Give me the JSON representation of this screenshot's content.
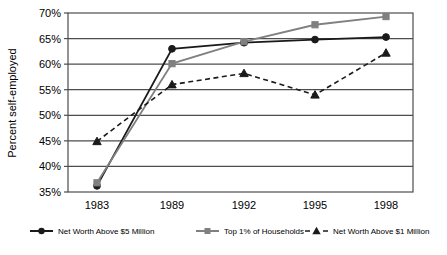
{
  "chart_data": {
    "type": "line",
    "title": "",
    "xlabel": "",
    "ylabel": "Percent self-employed",
    "categories": [
      "1983",
      "1989",
      "1992",
      "1995",
      "1998"
    ],
    "ylim": [
      35,
      70
    ],
    "ytick_values": [
      35,
      40,
      45,
      50,
      55,
      60,
      65,
      70
    ],
    "ytick_labels": [
      "35%",
      "40%",
      "45%",
      "50%",
      "55%",
      "60%",
      "65%",
      "70%"
    ],
    "grid": true,
    "grid_axis": "y",
    "legend_position": "bottom",
    "series": [
      {
        "name": "Net Worth Above $5 Million",
        "marker": "circle",
        "linestyle": "solid",
        "color": "#1a1a1a",
        "values": [
          36.2,
          63.0,
          64.2,
          64.8,
          65.3
        ]
      },
      {
        "name": "Top 1% of Households",
        "marker": "square",
        "linestyle": "solid",
        "color": "#808080",
        "values": [
          36.8,
          60.1,
          64.4,
          67.7,
          69.3
        ]
      },
      {
        "name": "Net Worth Above $1 Million",
        "marker": "triangle",
        "linestyle": "dashed",
        "color": "#1a1a1a",
        "values": [
          44.9,
          56.0,
          58.2,
          54.0,
          62.2
        ]
      }
    ]
  },
  "axes": {
    "y_title": "Percent self-employed",
    "y_ticks": [
      "70%",
      "65%",
      "60%",
      "55%",
      "50%",
      "45%",
      "40%",
      "35%"
    ],
    "x_ticks": [
      "1983",
      "1989",
      "1992",
      "1995",
      "1998"
    ]
  },
  "legend": {
    "items": [
      {
        "label": "Net Worth Above $5 Million",
        "marker": "circle-marker-icon",
        "color": "#1a1a1a"
      },
      {
        "label": "Top 1% of Households",
        "marker": "square-marker-icon",
        "color": "#808080"
      },
      {
        "label": "Net Worth Above $1 Million",
        "marker": "triangle-marker-icon",
        "color": "#1a1a1a"
      }
    ]
  },
  "colors": {
    "series_1": "#1a1a1a",
    "series_2": "#808080",
    "series_3": "#1a1a1a",
    "axis": "#4d4d4d",
    "grid": "#4d4d4d",
    "background": "#ffffff"
  }
}
